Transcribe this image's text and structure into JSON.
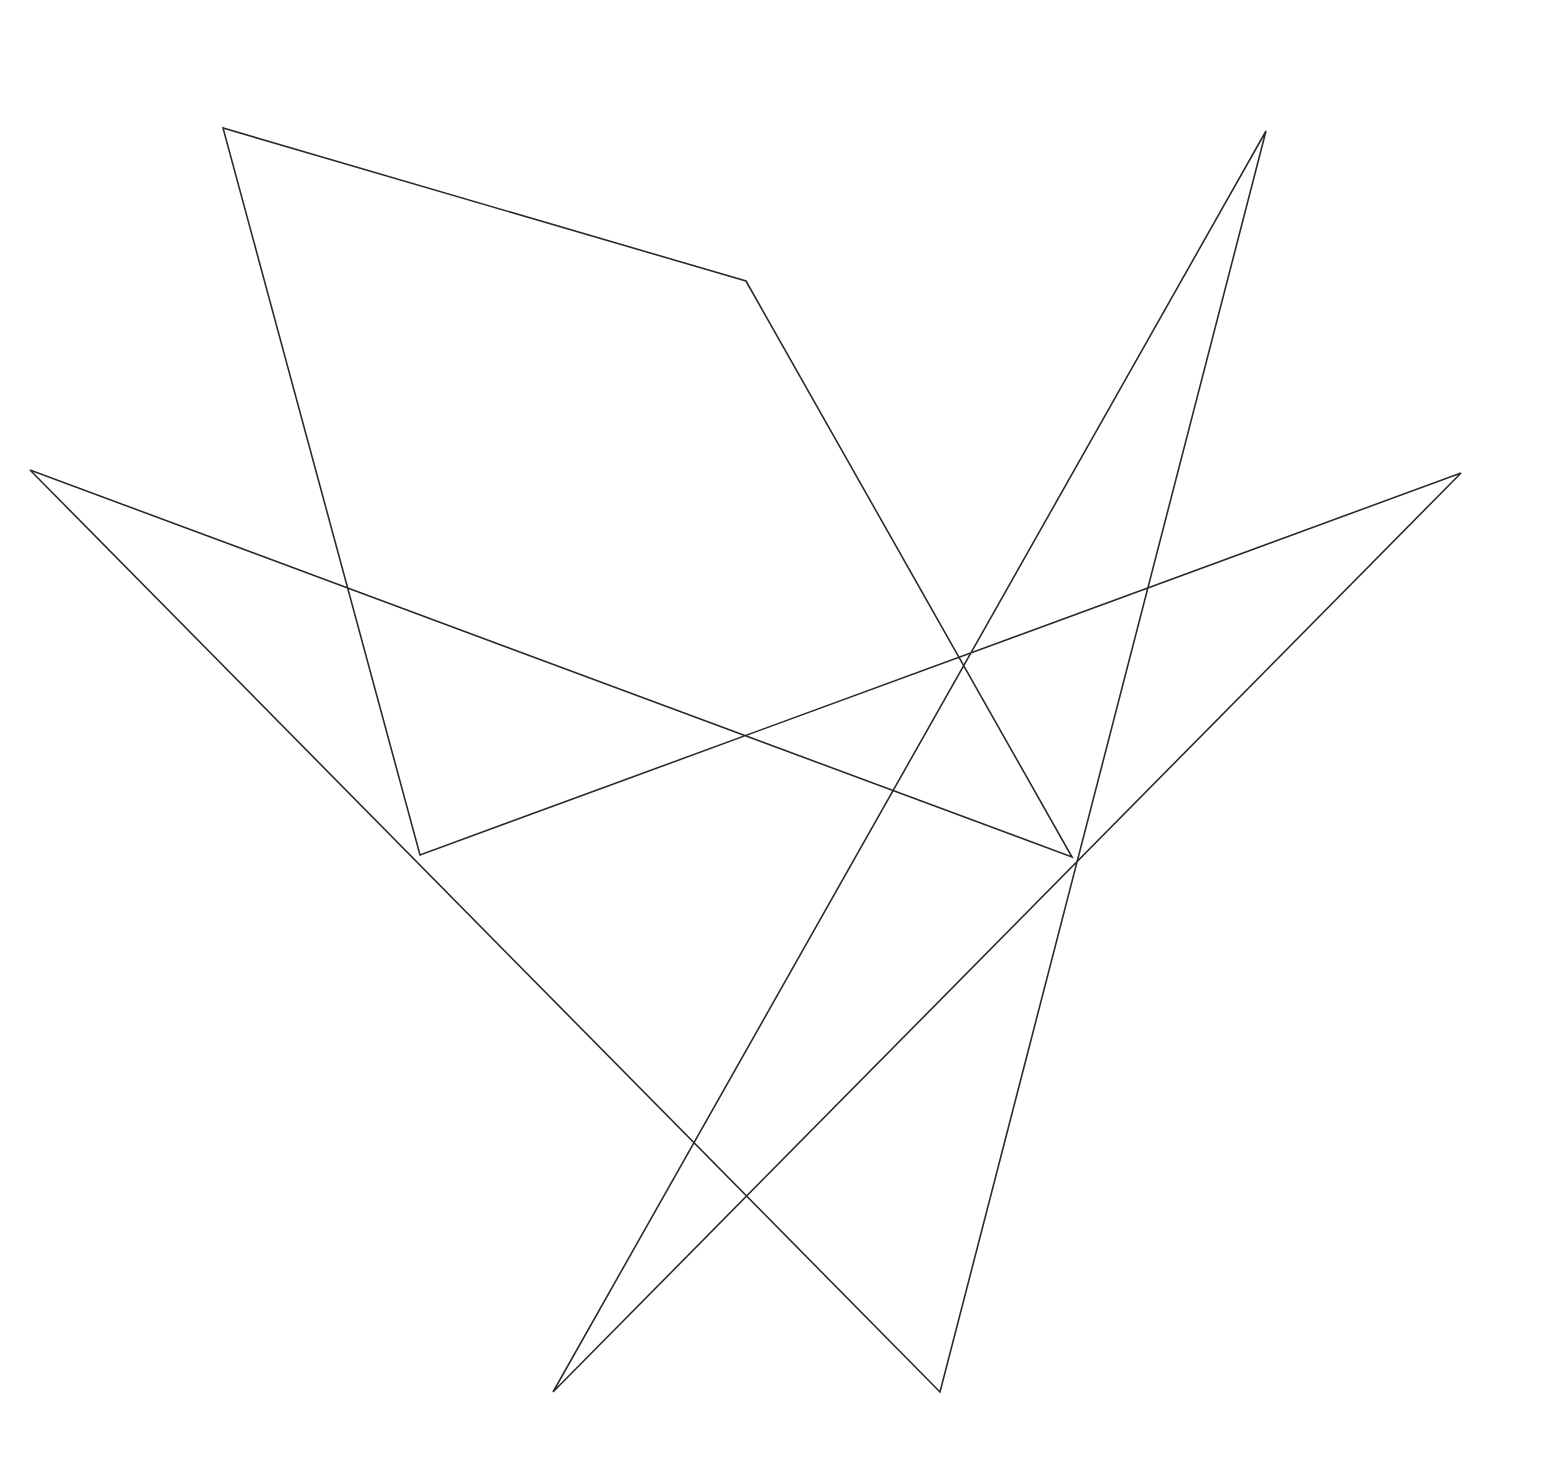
{
  "document": {
    "title": "Nonagram Star Polygon",
    "background_color": "#ffffff",
    "width": 1543,
    "height": 1480
  },
  "figure": {
    "name": "star-polygon-nonagram",
    "stroke_color": "#2b2b2b",
    "stroke_width": 1.6,
    "fill": "none",
    "closed": true
  },
  "chart_data": {
    "type": "line",
    "subtitle": "",
    "xlabel": "",
    "ylabel": "",
    "xlim": [
      0,
      1543
    ],
    "ylim": [
      0,
      1480
    ],
    "grid": false,
    "legend": "none",
    "axes_visible": false,
    "tick_labels_x": [],
    "tick_labels_y": [],
    "annotations": [],
    "series": [
      {
        "name": "star-outline",
        "closed": true,
        "stroke": "#2b2b2b",
        "points": [
          [
            746,
            281
          ],
          [
            1072,
            857
          ],
          [
            30,
            470
          ],
          [
            940,
            1392
          ],
          [
            1266,
            131
          ],
          [
            553,
            1392
          ],
          [
            1461,
            473
          ],
          [
            420,
            855
          ],
          [
            223,
            128
          ]
        ]
      }
    ],
    "vertices": [
      {
        "id": "v1",
        "label": "top-center-point",
        "x": 746,
        "y": 281
      },
      {
        "id": "v2",
        "label": "upper-right-point",
        "x": 1266,
        "y": 131
      },
      {
        "id": "v3",
        "label": "right-point",
        "x": 1461,
        "y": 473
      },
      {
        "id": "v4",
        "label": "mid-right-point",
        "x": 1072,
        "y": 857
      },
      {
        "id": "v5",
        "label": "bottom-right-point",
        "x": 940,
        "y": 1392
      },
      {
        "id": "v6",
        "label": "bottom-left-point",
        "x": 553,
        "y": 1392
      },
      {
        "id": "v7",
        "label": "mid-left-point",
        "x": 420,
        "y": 855
      },
      {
        "id": "v8",
        "label": "left-point",
        "x": 30,
        "y": 470
      },
      {
        "id": "v9",
        "label": "upper-left-point",
        "x": 223,
        "y": 128
      }
    ],
    "step": 4,
    "num_points": 9,
    "path_d": "M 746 281 L 1072 857 L 30 470 L 940 1392 L 1266 131 L 553 1392 L 1461 473 L 420 855 L 223 128 Z"
  }
}
